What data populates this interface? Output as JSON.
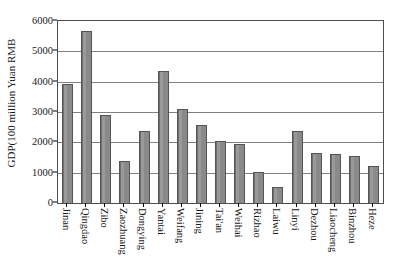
{
  "chart_data": {
    "type": "bar",
    "title": "",
    "subtitle": "",
    "xlabel": "",
    "ylabel": "GDP(100 million Yuan RMB",
    "ylim": [
      0,
      6000
    ],
    "ytick_labels": [
      "6000",
      "5000",
      "4000",
      "3000",
      "2000",
      "1000",
      "0"
    ],
    "yticks": [
      6000,
      5000,
      4000,
      3000,
      2000,
      1000,
      0
    ],
    "grid": true,
    "legend": false,
    "legend_position": "none",
    "bar_color": "#8e8e8e",
    "bar_border_color": "#555555",
    "gridline_color": "#808080",
    "axis_color": "#4d4d4d",
    "categories": [
      "Jinan",
      "Qingdao",
      "Zibo",
      "Zaozhuang",
      "Dongying",
      "Yantai",
      "Weifang",
      "Jining",
      "Tai'an",
      "Weihai",
      "Rizhao",
      "Laiwu",
      "Linyi",
      "Dezhou",
      "Liaocheng",
      "Binzhou",
      "Heze"
    ],
    "values": [
      3910,
      5670,
      2890,
      1375,
      2375,
      4340,
      3105,
      2565,
      2050,
      1950,
      1020,
      520,
      2385,
      1660,
      1605,
      1540,
      1225
    ]
  }
}
